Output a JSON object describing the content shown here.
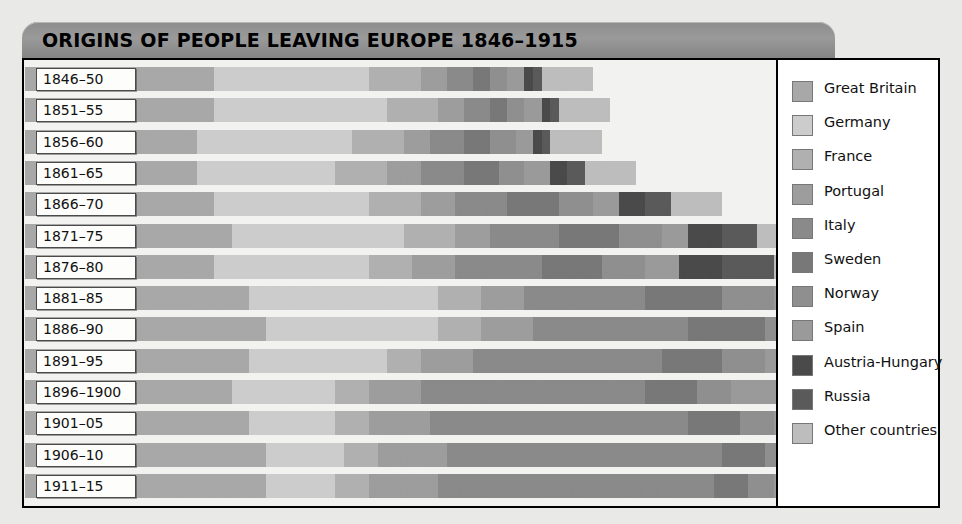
{
  "title": "ORIGINS OF PEOPLE LEAVING EUROPE 1846–1915",
  "legend": {
    "items": [
      {
        "label": "Great Britain",
        "color": "#a8a8a8"
      },
      {
        "label": "Germany",
        "color": "#cccccc"
      },
      {
        "label": "France",
        "color": "#b0b0b0"
      },
      {
        "label": "Portugal",
        "color": "#9d9d9d"
      },
      {
        "label": "Italy",
        "color": "#8a8a8a"
      },
      {
        "label": "Sweden",
        "color": "#787878"
      },
      {
        "label": "Norway",
        "color": "#8f8f8f"
      },
      {
        "label": "Spain",
        "color": "#9a9a9a"
      },
      {
        "label": "Austria-Hungary",
        "color": "#4a4a4a"
      },
      {
        "label": "Russia",
        "color": "#5a5a5a"
      },
      {
        "label": "Other countries",
        "color": "#bdbdbd"
      }
    ]
  },
  "chart_data": {
    "type": "bar",
    "title": "ORIGINS OF PEOPLE LEAVING EUROPE 1846–1915",
    "subtype": "stacked-pictogram",
    "unit": "one figure icon = one unit of emigrants",
    "xlabel": "",
    "ylabel": "",
    "grid": false,
    "legend_position": "right",
    "categories": [
      "1846–50",
      "1851–55",
      "1856–60",
      "1861–65",
      "1866–70",
      "1871–75",
      "1876–80",
      "1881–85",
      "1886–90",
      "1891–95",
      "1896–1900",
      "1901–05",
      "1906–10",
      "1911–15"
    ],
    "series_order": [
      "Great Britain",
      "Germany",
      "France",
      "Portugal",
      "Italy",
      "Sweden",
      "Norway",
      "Spain",
      "Austria-Hungary",
      "Russia",
      "Other countries"
    ],
    "series": [
      {
        "name": "Great Britain",
        "values": [
          22,
          22,
          20,
          20,
          22,
          24,
          22,
          26,
          28,
          26,
          24,
          26,
          28,
          28
        ]
      },
      {
        "name": "Germany",
        "values": [
          18,
          20,
          18,
          16,
          18,
          20,
          18,
          22,
          20,
          16,
          12,
          10,
          9,
          8
        ]
      },
      {
        "name": "France",
        "values": [
          6,
          6,
          6,
          6,
          6,
          6,
          5,
          5,
          5,
          4,
          4,
          4,
          4,
          4
        ]
      },
      {
        "name": "Portugal",
        "values": [
          3,
          3,
          3,
          4,
          4,
          4,
          5,
          5,
          6,
          6,
          6,
          7,
          8,
          8
        ]
      },
      {
        "name": "Italy",
        "values": [
          3,
          3,
          4,
          5,
          6,
          8,
          10,
          14,
          18,
          22,
          26,
          30,
          32,
          32
        ]
      },
      {
        "name": "Sweden",
        "values": [
          2,
          2,
          3,
          4,
          6,
          7,
          7,
          9,
          9,
          7,
          6,
          6,
          5,
          4
        ]
      },
      {
        "name": "Norway",
        "values": [
          2,
          2,
          3,
          3,
          4,
          5,
          5,
          6,
          6,
          5,
          4,
          4,
          4,
          3
        ]
      },
      {
        "name": "Spain",
        "values": [
          2,
          2,
          2,
          3,
          3,
          3,
          4,
          5,
          6,
          7,
          8,
          9,
          10,
          10
        ]
      },
      {
        "name": "Austria-Hungary",
        "values": [
          1,
          1,
          1,
          2,
          3,
          4,
          5,
          7,
          10,
          14,
          18,
          22,
          24,
          24
        ]
      },
      {
        "name": "Russia",
        "values": [
          1,
          1,
          1,
          2,
          3,
          4,
          6,
          8,
          11,
          14,
          16,
          18,
          20,
          20
        ]
      },
      {
        "name": "Other countries",
        "values": [
          6,
          6,
          6,
          6,
          6,
          6,
          6,
          6,
          6,
          6,
          6,
          6,
          6,
          6
        ]
      }
    ],
    "row_totals": [
      66,
      68,
      67,
      71,
      81,
      91,
      93,
      113,
      125,
      127,
      130,
      142,
      150,
      149
    ]
  }
}
